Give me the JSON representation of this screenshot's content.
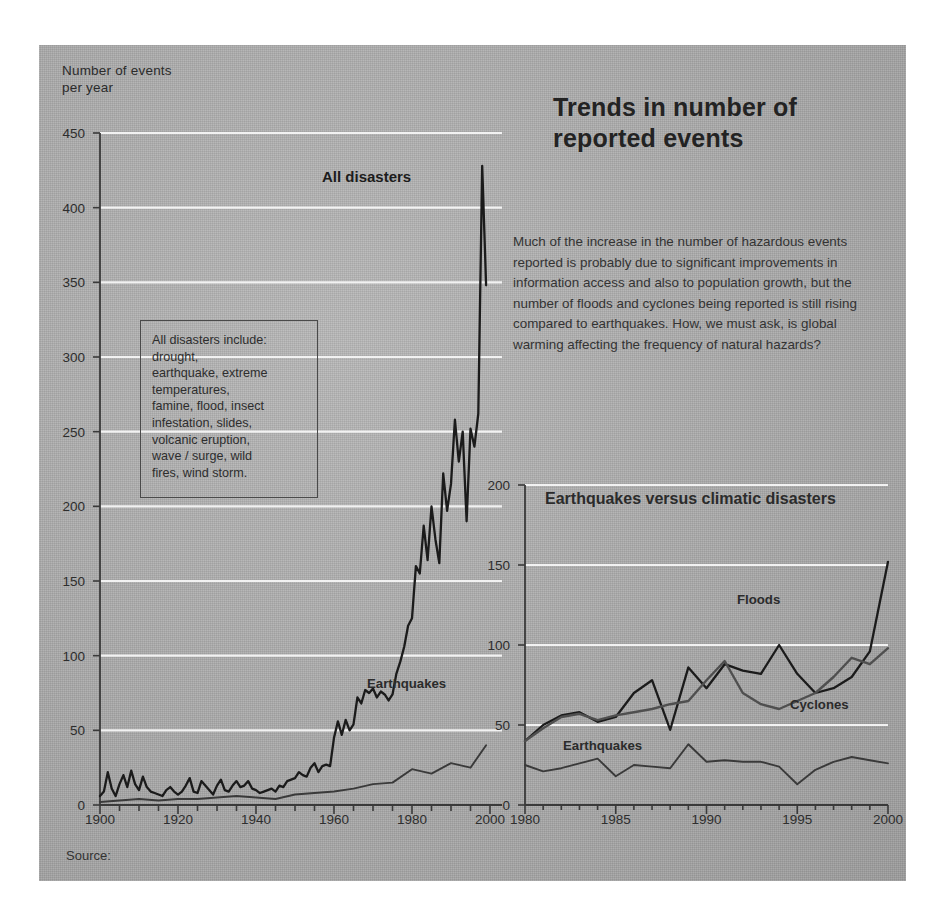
{
  "figure": {
    "title": "Trends in number\nof reported events",
    "body_text": "Much of the increase in the number of hazardous events reported is probably due to significant improvements in information access and also to population growth, but the number of floods and cyclones being reported is still rising compared to earthquakes. How, we must ask, is global warming affecting the frequency of natural hazards?",
    "source_label": "Source:",
    "axis_caption": "Number of events\nper year",
    "legend_box_text": "All disasters include:\ndrought,\nearthquake, extreme\ntemperatures,\nfamine, flood, insect\ninfestation, slides,\nvolcanic eruption,\nwave / surge, wild\nfires, wind storm.",
    "colors": {
      "panel_background": "#b0b0b0",
      "gridline": "#f2f2f2",
      "axis": "#3a3a3a",
      "all_disasters_line": "#1b1b1b",
      "earthquakes_line": "#3a3a3a",
      "floods_line": "#1b1b1b",
      "cyclones_line": "#4f4f4f",
      "text": "#2d2d2d"
    }
  },
  "chart_data": [
    {
      "type": "line",
      "id": "main",
      "title": "Trends in number of reported events",
      "xlabel": "",
      "ylabel": "Number of events per year",
      "xlim": [
        1900,
        2000
      ],
      "ylim": [
        0,
        450
      ],
      "grid": true,
      "legend_position": "inline-annotations",
      "xticks": [
        1900,
        1920,
        1940,
        1960,
        1980,
        2000
      ],
      "yticks": [
        0,
        50,
        100,
        150,
        200,
        250,
        300,
        350,
        400,
        450
      ],
      "annotations": [
        "All disasters",
        "Earthquakes"
      ],
      "series": [
        {
          "name": "All disasters",
          "x": [
            1900,
            1901,
            1902,
            1903,
            1904,
            1905,
            1906,
            1907,
            1908,
            1909,
            1910,
            1911,
            1912,
            1913,
            1914,
            1915,
            1916,
            1917,
            1918,
            1919,
            1920,
            1921,
            1922,
            1923,
            1924,
            1925,
            1926,
            1927,
            1928,
            1929,
            1930,
            1931,
            1932,
            1933,
            1934,
            1935,
            1936,
            1937,
            1938,
            1939,
            1940,
            1941,
            1942,
            1943,
            1944,
            1945,
            1946,
            1947,
            1948,
            1949,
            1950,
            1951,
            1952,
            1953,
            1954,
            1955,
            1956,
            1957,
            1958,
            1959,
            1960,
            1961,
            1962,
            1963,
            1964,
            1965,
            1966,
            1967,
            1968,
            1969,
            1970,
            1971,
            1972,
            1973,
            1974,
            1975,
            1976,
            1977,
            1978,
            1979,
            1980,
            1981,
            1982,
            1983,
            1984,
            1985,
            1986,
            1987,
            1988,
            1989,
            1990,
            1991,
            1992,
            1993,
            1994,
            1995,
            1996,
            1997,
            1998,
            1999
          ],
          "values": [
            6,
            9,
            22,
            11,
            6,
            14,
            20,
            12,
            23,
            14,
            10,
            19,
            12,
            9,
            8,
            7,
            6,
            10,
            12,
            9,
            7,
            9,
            13,
            18,
            9,
            8,
            16,
            13,
            10,
            7,
            13,
            17,
            10,
            9,
            13,
            16,
            12,
            13,
            16,
            11,
            10,
            8,
            9,
            10,
            11,
            9,
            13,
            12,
            16,
            17,
            18,
            22,
            20,
            19,
            25,
            28,
            22,
            26,
            27,
            26,
            45,
            56,
            47,
            57,
            50,
            54,
            72,
            68,
            77,
            75,
            78,
            72,
            76,
            74,
            70,
            74,
            88,
            96,
            106,
            120,
            125,
            160,
            155,
            187,
            164,
            200,
            178,
            162,
            222,
            197,
            215,
            258,
            230,
            250,
            190,
            252,
            240,
            262,
            428,
            348
          ]
        },
        {
          "name": "Earthquakes",
          "x": [
            1900,
            1905,
            1910,
            1915,
            1920,
            1925,
            1930,
            1935,
            1940,
            1945,
            1950,
            1955,
            1960,
            1965,
            1970,
            1975,
            1980,
            1985,
            1990,
            1995,
            1999
          ],
          "values": [
            2,
            3,
            4,
            3,
            4,
            4,
            5,
            6,
            5,
            4,
            7,
            8,
            9,
            11,
            14,
            15,
            24,
            21,
            28,
            25,
            40
          ]
        }
      ]
    },
    {
      "type": "line",
      "id": "inset",
      "title": "Earthquakes\nversus climatic disasters",
      "xlabel": "",
      "ylabel": "",
      "xlim": [
        1980,
        2000
      ],
      "ylim": [
        0,
        200
      ],
      "grid": true,
      "legend_position": "inline-annotations",
      "xticks": [
        1980,
        1985,
        1990,
        1995,
        2000
      ],
      "yticks": [
        0,
        50,
        100,
        150,
        200
      ],
      "annotations": [
        "Floods",
        "Cyclones",
        "Earthquakes"
      ],
      "series": [
        {
          "name": "Floods",
          "x": [
            1980,
            1981,
            1982,
            1983,
            1984,
            1985,
            1986,
            1987,
            1988,
            1989,
            1990,
            1991,
            1992,
            1993,
            1994,
            1995,
            1996,
            1997,
            1998,
            1999,
            2000
          ],
          "values": [
            40,
            50,
            56,
            58,
            52,
            55,
            70,
            78,
            47,
            86,
            73,
            88,
            84,
            82,
            100,
            82,
            70,
            73,
            80,
            96,
            152
          ]
        },
        {
          "name": "Cyclones",
          "x": [
            1980,
            1981,
            1982,
            1983,
            1984,
            1985,
            1986,
            1987,
            1988,
            1989,
            1990,
            1991,
            1992,
            1993,
            1994,
            1995,
            1996,
            1997,
            1998,
            1999,
            2000
          ],
          "values": [
            40,
            48,
            55,
            57,
            53,
            56,
            58,
            60,
            63,
            65,
            78,
            90,
            70,
            63,
            60,
            65,
            70,
            80,
            92,
            88,
            98
          ]
        },
        {
          "name": "Earthquakes",
          "x": [
            1980,
            1981,
            1982,
            1983,
            1984,
            1985,
            1986,
            1987,
            1988,
            1989,
            1990,
            1991,
            1992,
            1993,
            1994,
            1995,
            1996,
            1997,
            1998,
            1999,
            2000
          ],
          "values": [
            25,
            21,
            23,
            26,
            29,
            18,
            25,
            24,
            23,
            38,
            27,
            28,
            27,
            27,
            24,
            13,
            22,
            27,
            30,
            28,
            26
          ]
        }
      ]
    }
  ]
}
